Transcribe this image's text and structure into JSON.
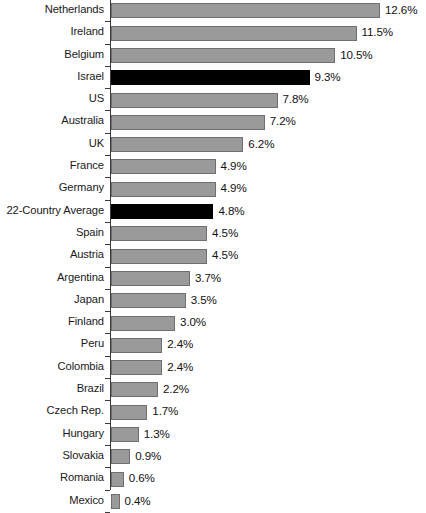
{
  "chart_data": {
    "type": "bar",
    "orientation": "horizontal",
    "title": "",
    "subtitle": "",
    "xlabel": "",
    "ylabel": "",
    "xlim": [
      0,
      14
    ],
    "grid": false,
    "legend_position": "none",
    "value_suffix": "%",
    "categories": [
      "Netherlands",
      "Ireland",
      "Belgium",
      "Israel",
      "US",
      "Australia",
      "UK",
      "France",
      "Germany",
      "22-Country Average",
      "Spain",
      "Austria",
      "Argentina",
      "Japan",
      "Finland",
      "Peru",
      "Colombia",
      "Brazil",
      "Czech Rep.",
      "Hungary",
      "Slovakia",
      "Romania",
      "Mexico"
    ],
    "values": [
      12.6,
      11.5,
      10.5,
      9.3,
      7.8,
      7.2,
      6.2,
      4.9,
      4.9,
      4.8,
      4.5,
      4.5,
      3.7,
      3.5,
      3.0,
      2.4,
      2.4,
      2.2,
      1.7,
      1.3,
      0.9,
      0.6,
      0.4
    ],
    "value_labels": [
      "12.6%",
      "11.5%",
      "10.5%",
      "9.3%",
      "7.8%",
      "7.2%",
      "6.2%",
      "4.9%",
      "4.9%",
      "4.8%",
      "4.5%",
      "4.5%",
      "3.7%",
      "3.5%",
      "3.0%",
      "2.4%",
      "2.4%",
      "2.2%",
      "1.7%",
      "1.3%",
      "0.9%",
      "0.6%",
      "0.4%"
    ],
    "highlighted": [
      "Israel",
      "22-Country Average"
    ],
    "colors": {
      "bar": "#9a9a9a",
      "bar_border": "#6f6f6f",
      "bar_highlight": "#000000",
      "axis": "#3a3a3a",
      "text": "#121212",
      "background": "#ffffff"
    },
    "px_per_unit": 21.35
  }
}
